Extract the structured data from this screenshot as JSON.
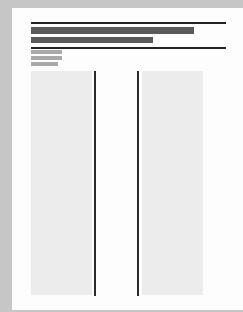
{
  "document": {
    "type": "page-layout-thumbnail",
    "header": {
      "title_lines": 2,
      "title_bar_widths_px": [
        163,
        122
      ]
    },
    "meta_lines": 3,
    "meta_bar_widths_px": [
      31,
      31,
      27
    ],
    "columns": 2
  },
  "colors": {
    "background": "#c6c6c6",
    "page": "#fdfdfd",
    "rule": "#222222",
    "title_bar": "#5a5a5a",
    "meta_bar": "#a9a9a9",
    "column_fill": "#ececec",
    "column_divider": "#2a2a2a"
  }
}
